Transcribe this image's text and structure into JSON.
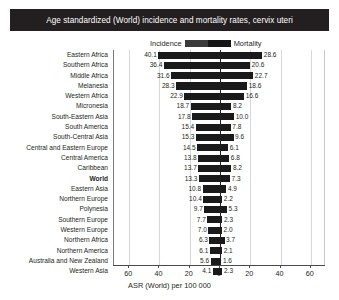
{
  "title": "Age standardized (World) incidence and mortality rates, cervix uteri",
  "legend": {
    "incidence_label": "Incidence",
    "mortality_label": "Mortality",
    "incidence_color": "#3a3a3a",
    "mortality_color": "#161616"
  },
  "axis": {
    "title": "ASR (World) per 100 000",
    "ticks": [
      "60",
      "40",
      "20",
      "0",
      "20",
      "40",
      "60"
    ],
    "max": 70
  },
  "chart_data": {
    "type": "bar",
    "title": "Age standardized (World) incidence and mortality rates, cervix uteri",
    "xlabel": "ASR (World) per 100 000",
    "ylabel": "",
    "orientation": "horizontal-diverging",
    "xlim": [
      -70,
      70
    ],
    "grid": true,
    "legend_position": "top-center",
    "categories": [
      "Eastern Africa",
      "Southern Africa",
      "Middle Africa",
      "Melanesia",
      "Western Africa",
      "Micronesia",
      "South-Eastern Asia",
      "South America",
      "South-Central Asia",
      "Central and Eastern Europe",
      "Central America",
      "Caribbean",
      "World",
      "Eastern Asia",
      "Northern Europe",
      "Polynesia",
      "Southern Europe",
      "Western Europe",
      "Northern Africa",
      "Northern America",
      "Australia and New Zealand",
      "Western Asia"
    ],
    "series": [
      {
        "name": "Incidence",
        "side": "left",
        "values": [
          40.1,
          36.4,
          31.6,
          28.3,
          22.9,
          18.7,
          17.8,
          15.4,
          15.3,
          14.5,
          13.8,
          13.7,
          13.3,
          10.8,
          10.4,
          9.7,
          7.7,
          7.0,
          6.3,
          6.1,
          5.6,
          4.1
        ]
      },
      {
        "name": "Mortality",
        "side": "right",
        "values": [
          28.6,
          20.6,
          22.7,
          18.6,
          16.6,
          8.2,
          10.0,
          7.8,
          9.6,
          6.1,
          6.8,
          8.2,
          7.3,
          4.9,
          2.2,
          5.3,
          2.3,
          2.0,
          3.7,
          2.1,
          1.6,
          2.3
        ]
      }
    ]
  }
}
